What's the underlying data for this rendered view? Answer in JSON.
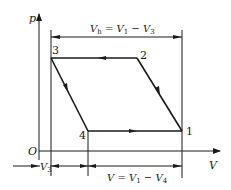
{
  "diagram": {
    "axes": {
      "y_label": "p",
      "x_label": "V",
      "origin_label": "O"
    },
    "points": [
      {
        "id": "1",
        "label": "1"
      },
      {
        "id": "2",
        "label": "2"
      },
      {
        "id": "3",
        "label": "3"
      },
      {
        "id": "4",
        "label": "4"
      }
    ],
    "dimensions": {
      "top": {
        "lhs": "V",
        "lhs_sub": "h",
        "eq": " = V",
        "v1_sub": "1",
        "minus": " − V",
        "v3_sub": "3"
      },
      "left": {
        "var": "V",
        "sub": "3"
      },
      "bottom": {
        "lhs": "V = V",
        "v1_sub": "1",
        "minus": " − V",
        "v4_sub": "4"
      }
    },
    "colors": {
      "line": "#1a1a1a",
      "background": "#ffffff"
    }
  }
}
